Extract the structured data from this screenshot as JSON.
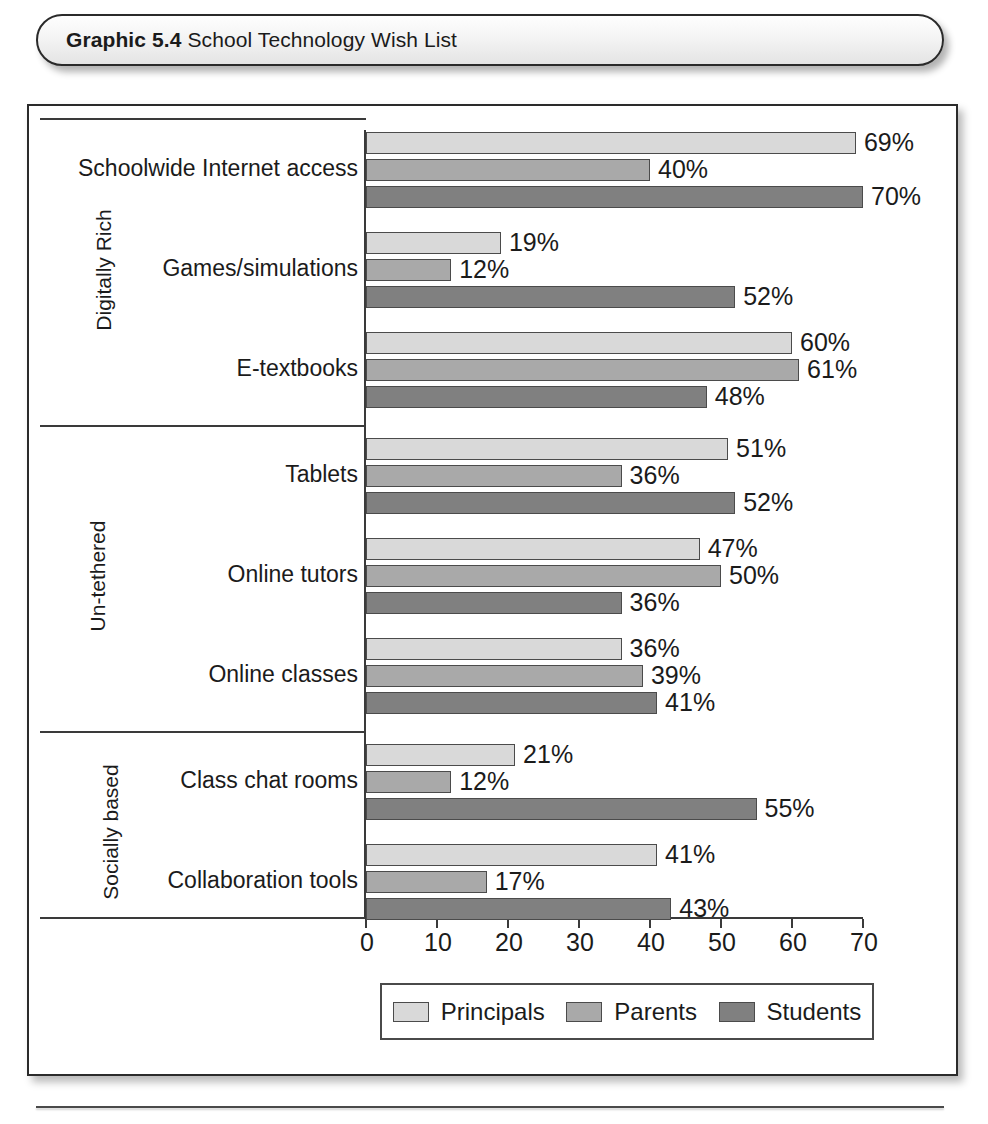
{
  "title": {
    "label": "Graphic 5.4",
    "text": " School Technology Wish List"
  },
  "chart_data": {
    "type": "bar",
    "orientation": "horizontal",
    "title": "School Technology Wish List",
    "xlabel": "",
    "ylabel": "",
    "xlim": [
      0,
      70
    ],
    "xticks": [
      0,
      10,
      20,
      30,
      40,
      50,
      60,
      70
    ],
    "grid": false,
    "legend_position": "bottom",
    "value_suffix": "%",
    "series": [
      {
        "name": "Principals",
        "color": "#d9d9d9",
        "values": [
          69,
          19,
          60,
          51,
          47,
          36,
          21,
          41
        ]
      },
      {
        "name": "Parents",
        "color": "#a9a9a9",
        "values": [
          40,
          12,
          61,
          36,
          50,
          39,
          12,
          17
        ]
      },
      {
        "name": "Students",
        "color": "#808080",
        "values": [
          70,
          52,
          48,
          52,
          36,
          41,
          55,
          43
        ]
      }
    ],
    "categories": [
      "Schoolwide Internet access",
      "Games/simulations",
      "E-textbooks",
      "Tablets",
      "Online tutors",
      "Online classes",
      "Class chat rooms",
      "Collaboration tools"
    ],
    "groups": [
      {
        "label": "Digitally Rich",
        "categories": [
          "Schoolwide Internet access",
          "Games/simulations",
          "E-textbooks"
        ]
      },
      {
        "label": "Un-tethered",
        "categories": [
          "Tablets",
          "Online tutors",
          "Online classes"
        ]
      },
      {
        "label": "Socially based",
        "categories": [
          "Class chat rooms",
          "Collaboration tools"
        ]
      }
    ],
    "data_labels": [
      {
        "category": "Schoolwide Internet access",
        "Principals": "69%",
        "Parents": "40%",
        "Students": "70%"
      },
      {
        "category": "Games/simulations",
        "Principals": "19%",
        "Parents": "12%",
        "Students": "52%"
      },
      {
        "category": "E-textbooks",
        "Principals": "60%",
        "Parents": "61%",
        "Students": "48%"
      },
      {
        "category": "Tablets",
        "Principals": "51%",
        "Parents": "36%",
        "Students": "52%"
      },
      {
        "category": "Online tutors",
        "Principals": "47%",
        "Parents": "50%",
        "Students": "36%"
      },
      {
        "category": "Online classes",
        "Principals": "36%",
        "Parents": "39%",
        "Students": "41%"
      },
      {
        "category": "Class chat rooms",
        "Principals": "21%",
        "Parents": "12%",
        "Students": "55%"
      },
      {
        "category": "Collaboration tools",
        "Principals": "41%",
        "Parents": "17%",
        "Students": "43%"
      }
    ]
  }
}
